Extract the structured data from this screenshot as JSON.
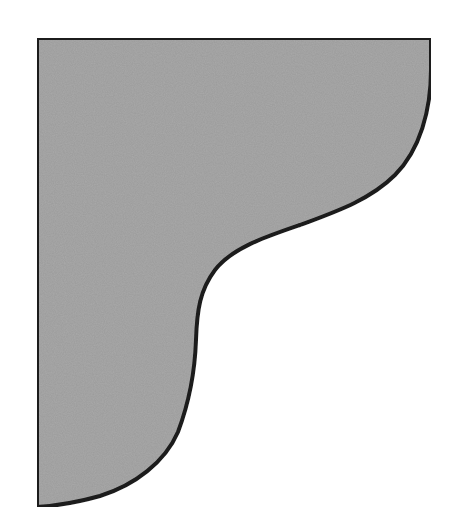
{
  "diagram": {
    "shape": "bracket-corbel-profile",
    "fill_color": "#a8a8a8",
    "stroke_color": "#1a1a1a",
    "stroke_width": 4,
    "background": "#ffffff"
  }
}
